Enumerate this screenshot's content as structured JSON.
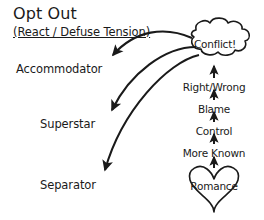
{
  "diagram": {
    "title": "Opt Out",
    "subtitle": "(React / Defuse Tension)",
    "outcomes": [
      {
        "label": "Accommodator"
      },
      {
        "label": "Superstar"
      },
      {
        "label": "Separator"
      }
    ],
    "nodes": [
      {
        "id": "conflict",
        "label": "Conflict!",
        "shape": "cloud"
      },
      {
        "id": "romance",
        "label": "Romance",
        "shape": "heart"
      }
    ],
    "escalation_chain": [
      {
        "label": "Right/Wrong"
      },
      {
        "label": "Blame"
      },
      {
        "label": "Control"
      },
      {
        "label": "More Known"
      }
    ],
    "colors": {
      "ink": "#1a1a1a",
      "background": "#ffffff"
    }
  }
}
